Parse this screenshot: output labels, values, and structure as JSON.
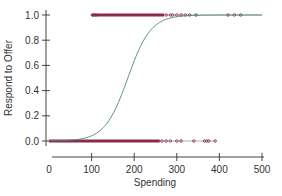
{
  "chart_data": {
    "type": "scatter",
    "title": "",
    "xlabel": "Spending",
    "ylabel": "Respond to Offer",
    "xlim": [
      0,
      500
    ],
    "ylim": [
      0.0,
      1.0
    ],
    "x_ticks": [
      "0",
      "100",
      "200",
      "300",
      "400",
      "500"
    ],
    "y_ticks": [
      "0.0",
      "0.2",
      "0.4",
      "0.6",
      "0.8",
      "1.0"
    ],
    "grid": false,
    "legend": null,
    "series": [
      {
        "name": "Responded (1)",
        "kind": "points",
        "y": 1.0,
        "x_dense_range": [
          100,
          270
        ],
        "x_sparse": [
          103,
          110,
          275,
          285,
          290,
          300,
          310,
          320,
          330,
          345,
          420,
          435,
          450
        ]
      },
      {
        "name": "Did not respond (0)",
        "kind": "points",
        "y": 0.0,
        "x_dense_range": [
          0,
          260
        ],
        "x_sparse": [
          265,
          275,
          285,
          300,
          310,
          340,
          365,
          370,
          375,
          390
        ]
      },
      {
        "name": "Logistic fit",
        "kind": "curve",
        "x": [
          0,
          50,
          100,
          125,
          150,
          175,
          200,
          225,
          250,
          275,
          300,
          350,
          400,
          500
        ],
        "y": [
          0.0,
          0.02,
          0.08,
          0.17,
          0.34,
          0.57,
          0.77,
          0.89,
          0.95,
          0.98,
          0.99,
          1.0,
          1.0,
          1.0
        ]
      }
    ],
    "colors": {
      "points": "#8b2a4a",
      "curve": "#4a8c72",
      "axis": "#444444"
    }
  }
}
